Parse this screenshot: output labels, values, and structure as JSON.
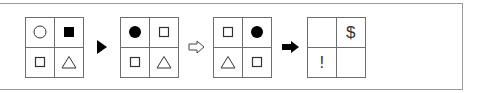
{
  "puzzle": {
    "grids": [
      {
        "cells": [
          "circle-outline",
          "square-filled",
          "square-outline",
          "triangle-outline"
        ]
      },
      {
        "cells": [
          "circle-filled",
          "square-outline",
          "square-outline",
          "triangle-outline"
        ]
      },
      {
        "cells": [
          "square-outline",
          "circle-filled",
          "triangle-outline",
          "square-outline"
        ]
      },
      {
        "cells": [
          "",
          "$",
          "!",
          ""
        ]
      }
    ],
    "arrows": [
      "triangle-arrow-filled",
      "block-arrow-outline",
      "block-arrow-filled"
    ],
    "symbols": {
      "dollar": "$",
      "exclaim": "!"
    },
    "colors": {
      "line": "#6e6e6e",
      "fill": "#000000",
      "frame": "#9a9a9a"
    }
  }
}
